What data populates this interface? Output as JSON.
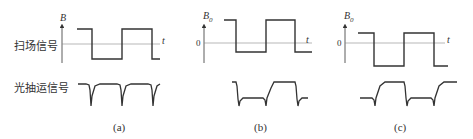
{
  "row_labels": {
    "scan_signal": "扫场信号",
    "photoextraction_signal": "光抽运信号"
  },
  "panels": [
    {
      "id": "a",
      "caption": "(a)",
      "y_axis_label": "B",
      "y_axis_subscript": "",
      "x_axis_label": "t",
      "zero_label": ""
    },
    {
      "id": "b",
      "caption": "(b)",
      "y_axis_label": "B",
      "y_axis_subscript": "0",
      "x_axis_label": "t",
      "zero_label": "0"
    },
    {
      "id": "c",
      "caption": "(c)",
      "y_axis_label": "B",
      "y_axis_subscript": "0",
      "x_axis_label": "t",
      "zero_label": "0"
    }
  ]
}
